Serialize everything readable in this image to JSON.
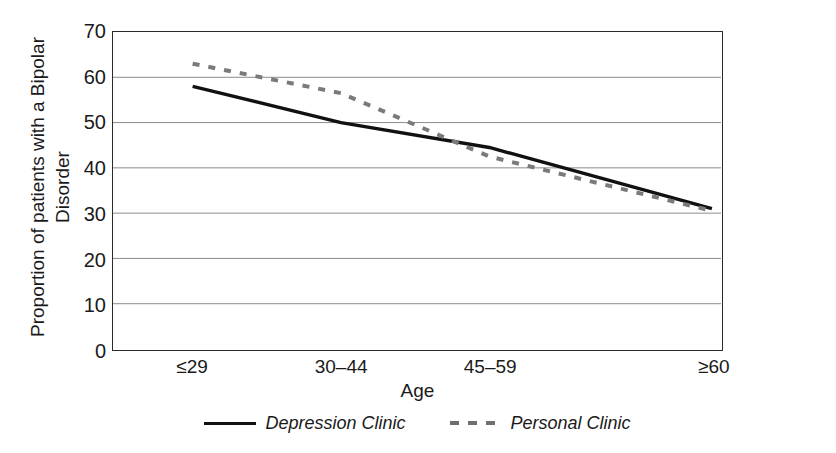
{
  "chart_data": {
    "type": "line",
    "title": "",
    "xlabel": "Age",
    "ylabel_line1": "Proportion of patients with a Bipolar",
    "ylabel_line2": "Disorder",
    "categories": [
      "≤29",
      "30–44",
      "45–59",
      "≥60"
    ],
    "yticks": [
      0,
      10,
      20,
      30,
      40,
      50,
      60,
      70
    ],
    "ytick_labels": [
      "0",
      "10",
      "20",
      "30",
      "40",
      "50",
      "60",
      "70"
    ],
    "ylim": [
      0,
      70
    ],
    "grid": "horizontal",
    "legend_position": "below-axis",
    "series": [
      {
        "name": "Depression Clinic",
        "style": "solid",
        "color": "#111111",
        "values": [
          58,
          50,
          44.5,
          31
        ]
      },
      {
        "name": "Personal Clinic",
        "style": "dashed",
        "color": "#7a7a7a",
        "values": [
          63,
          56.5,
          42.5,
          30.5
        ]
      }
    ]
  },
  "axes": {
    "xlabel": "Age",
    "ylabel_line1": "Proportion of patients with a Bipolar",
    "ylabel_line2": "Disorder"
  },
  "legend": {
    "items": [
      {
        "label": "Depression Clinic",
        "style": "solid"
      },
      {
        "label": "Personal Clinic",
        "style": "dashed"
      }
    ]
  },
  "colors": {
    "series_solid": "#111111",
    "series_dashed": "#7a7a7a",
    "gridline": "#8c8c8c",
    "axis": "#2b2b2b",
    "background": "#ffffff"
  }
}
